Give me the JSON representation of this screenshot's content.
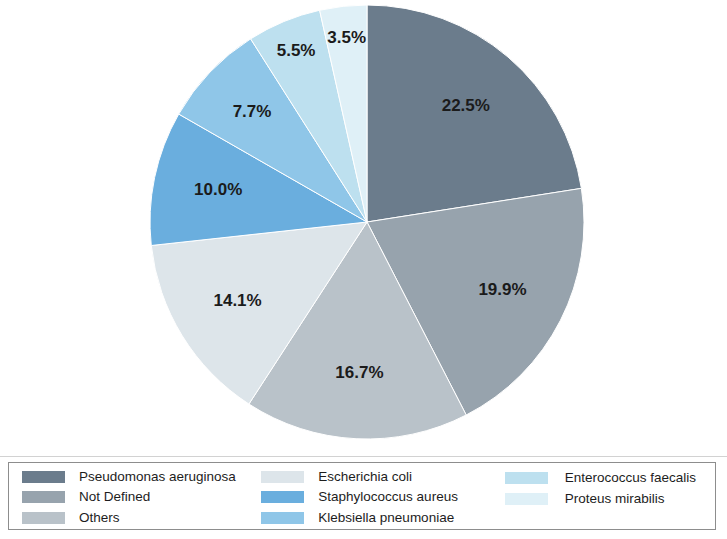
{
  "chart_data": {
    "type": "pie",
    "title": "",
    "subtitle": "",
    "xlabel": "",
    "ylabel": "",
    "grid": false,
    "legend_position": "bottom",
    "start_angle_deg": 0,
    "direction": "clockwise",
    "units": "percent",
    "total": 100.0,
    "categories": [
      "Pseudomonas aeruginosa",
      "Not Defined",
      "Others",
      "Escherichia coli",
      "Staphylococcus aureus",
      "Klebsiella pneumoniae",
      "Enterococcus faecalis",
      "Proteus mirabilis"
    ],
    "values": [
      22.5,
      19.9,
      16.7,
      14.1,
      10.0,
      7.7,
      5.5,
      3.5
    ],
    "labels": [
      "22.5%",
      "19.9%",
      "16.7%",
      "14.1%",
      "10.0%",
      "7.7%",
      "5.5%",
      "3.5%"
    ],
    "colors": [
      "#6b7c8c",
      "#97a3ad",
      "#b9c2c9",
      "#dde5ea",
      "#6aaede",
      "#8fc6e8",
      "#bde0ef",
      "#dff0f7"
    ],
    "slices": [
      {
        "label": "Pseudomonas aeruginosa",
        "value": 22.5,
        "display": "22.5%",
        "color": "#6b7c8c"
      },
      {
        "label": "Not Defined",
        "value": 19.9,
        "display": "19.9%",
        "color": "#97a3ad"
      },
      {
        "label": "Others",
        "value": 16.7,
        "display": "16.7%",
        "color": "#b9c2c9"
      },
      {
        "label": "Escherichia coli",
        "value": 14.1,
        "display": "14.1%",
        "color": "#dde5ea"
      },
      {
        "label": "Staphylococcus aureus",
        "value": 10.0,
        "display": "10.0%",
        "color": "#6aaede"
      },
      {
        "label": "Klebsiella pneumoniae",
        "value": 7.7,
        "display": "7.7%",
        "color": "#8fc6e8"
      },
      {
        "label": "Enterococcus faecalis",
        "value": 5.5,
        "display": "5.5%",
        "color": "#bde0ef"
      },
      {
        "label": "Proteus mirabilis",
        "value": 3.5,
        "display": "3.5%",
        "color": "#dff0f7"
      }
    ]
  },
  "geometry": {
    "center_x": 367,
    "center_y": 222,
    "radius": 217,
    "label_radius": 152
  },
  "legend": {
    "columns": [
      {
        "items": [
          {
            "label": "Pseudomonas aeruginosa",
            "color": "#6b7c8c"
          },
          {
            "label": "Not Defined",
            "color": "#97a3ad"
          },
          {
            "label": "Others",
            "color": "#b9c2c9"
          }
        ]
      },
      {
        "items": [
          {
            "label": "Escherichia coli",
            "color": "#dde5ea"
          },
          {
            "label": "Staphylococcus aureus",
            "color": "#6aaede"
          },
          {
            "label": "Klebsiella pneumoniae",
            "color": "#8fc6e8"
          }
        ]
      },
      {
        "items": [
          {
            "label": "Enterococcus faecalis",
            "color": "#bde0ef"
          },
          {
            "label": "Proteus mirabilis",
            "color": "#dff0f7"
          }
        ]
      }
    ]
  }
}
